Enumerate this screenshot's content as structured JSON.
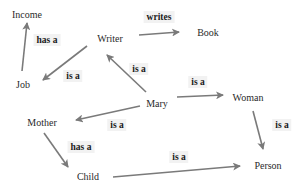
{
  "diagram": {
    "type": "semantic-network",
    "edge_color": "#7a7a7a",
    "nodes": {
      "income": "Income",
      "writer": "Writer",
      "book": "Book",
      "job": "Job",
      "mary": "Mary",
      "woman": "Woman",
      "mother": "Mother",
      "child": "Child",
      "person": "Person"
    },
    "edges": [
      {
        "from": "Job",
        "to": "Income",
        "label": "has a"
      },
      {
        "from": "Writer",
        "to": "Book",
        "label": "writes"
      },
      {
        "from": "Writer",
        "to": "Job",
        "label": "is a"
      },
      {
        "from": "Mary",
        "to": "Writer",
        "label": "is a"
      },
      {
        "from": "Mary",
        "to": "Woman",
        "label": "is a"
      },
      {
        "from": "Mary",
        "to": "Mother",
        "label": "is a"
      },
      {
        "from": "Woman",
        "to": "Person",
        "label": "is a"
      },
      {
        "from": "Mother",
        "to": "Child",
        "label": "has a"
      },
      {
        "from": "Child",
        "to": "Person",
        "label": "is a"
      }
    ]
  }
}
